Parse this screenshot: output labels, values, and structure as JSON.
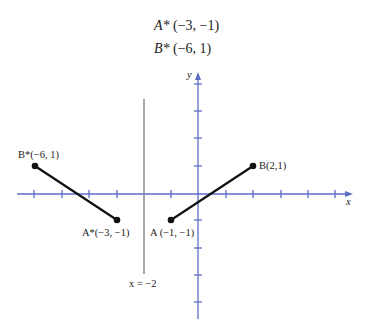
{
  "header": {
    "lines": [
      {
        "point": "A*",
        "coords": "(−3, −1)"
      },
      {
        "point": "B*",
        "coords": "(−6, 1)"
      }
    ]
  },
  "graph": {
    "x_axis_label": "x",
    "y_axis_label": "y",
    "reflection_line_label": "x = −2",
    "points": [
      {
        "name": "A",
        "label": "A (−1, −1)",
        "x": -1,
        "y": -1
      },
      {
        "name": "B",
        "label": "B(2,1)",
        "x": 2,
        "y": 1
      },
      {
        "name": "A*",
        "label": "A*(−3, −1)",
        "x": -3,
        "y": -1
      },
      {
        "name": "B*",
        "label": "B*(−6, 1)",
        "x": -6,
        "y": 1
      }
    ],
    "segments": [
      {
        "from": "A",
        "to": "B"
      },
      {
        "from": "A*",
        "to": "B*"
      }
    ],
    "reflection_line_x": -2,
    "colors": {
      "axes": "#5b6fc4",
      "segments": "#111111",
      "reflection_line": "#8a8a8a"
    }
  }
}
